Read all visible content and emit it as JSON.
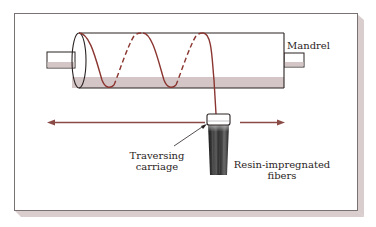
{
  "diagram": {
    "labels": {
      "mandrel": "Mandrel",
      "carriage_line1": "Traversing",
      "carriage_line2": "carriage",
      "fibers_line1": "Resin-impregnated",
      "fibers_line2": "fibers"
    },
    "colors": {
      "frame_border": "#7a7272",
      "frame_shadow": "#d9cdcd",
      "fiber_spiral": "#8a3530",
      "arrow": "#8a4a45",
      "cylinder_outline": "#2a2222",
      "cylinder_shade": "#d4c6c6",
      "fiber_bundle": "#222222"
    },
    "components": [
      "mandrel",
      "helical-fiber-winding",
      "traversing-carriage",
      "resin-impregnated-fiber-bundle",
      "left-motion-arrow",
      "right-motion-arrow"
    ]
  }
}
